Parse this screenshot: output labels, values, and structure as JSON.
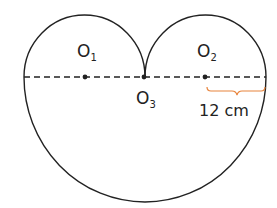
{
  "diagram": {
    "points": [
      {
        "name": "O",
        "sub": "1"
      },
      {
        "name": "O",
        "sub": "2"
      },
      {
        "name": "O",
        "sub": "3"
      }
    ],
    "measure_label": "12 cm",
    "colors": {
      "stroke": "#222222",
      "brace": "#e8843c"
    }
  }
}
